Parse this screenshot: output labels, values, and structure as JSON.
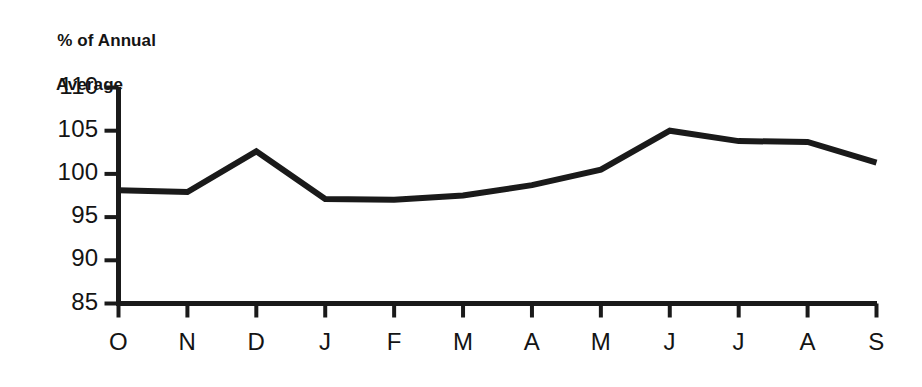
{
  "chart_data": {
    "type": "line",
    "title": "",
    "ylabel_line1": "% of Annual",
    "ylabel_line2": "Average",
    "xlabel": "",
    "categories": [
      "O",
      "N",
      "D",
      "J",
      "F",
      "M",
      "A",
      "M",
      "J",
      "J",
      "A",
      "S"
    ],
    "values": [
      98.1,
      97.9,
      102.6,
      97.1,
      97.0,
      97.5,
      98.7,
      100.5,
      105.0,
      103.8,
      103.7,
      101.3
    ],
    "ylim": [
      85,
      110
    ],
    "yticks": [
      110,
      105,
      100,
      95,
      90,
      85
    ],
    "ytick_labels": [
      "110",
      "105",
      "100",
      "95",
      "90",
      "85"
    ],
    "grid": false,
    "legend": false,
    "series": [
      {
        "name": "% of Annual Average",
        "color": "#1a1a1a",
        "values": [
          98.1,
          97.9,
          102.6,
          97.1,
          97.0,
          97.5,
          98.7,
          100.5,
          105.0,
          103.8,
          103.7,
          101.3
        ]
      }
    ]
  },
  "colors": {
    "line": "#1a1a1a",
    "axis": "#1a1a1a",
    "background": "#ffffff"
  }
}
